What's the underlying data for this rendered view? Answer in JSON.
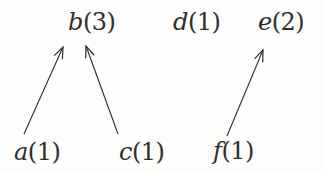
{
  "diagram": {
    "colors": {
      "ink": "#2e2e2e",
      "background": "#fdfdfc"
    },
    "nodes": [
      {
        "id": "b",
        "letter": "b",
        "count": "(3)",
        "label": "b(3)",
        "row": "top"
      },
      {
        "id": "d",
        "letter": "d",
        "count": "(1)",
        "label": "d(1)",
        "row": "top"
      },
      {
        "id": "e",
        "letter": "e",
        "count": "(2)",
        "label": "e(2)",
        "row": "top"
      },
      {
        "id": "a",
        "letter": "a",
        "count": "(1)",
        "label": "a(1)",
        "row": "bottom"
      },
      {
        "id": "c",
        "letter": "c",
        "count": "(1)",
        "label": "c(1)",
        "row": "bottom"
      },
      {
        "id": "f",
        "letter": "f",
        "count": "(1)",
        "label": "f(1)",
        "row": "bottom"
      }
    ],
    "edges": [
      {
        "from": "a",
        "to": "b"
      },
      {
        "from": "c",
        "to": "b"
      },
      {
        "from": "f",
        "to": "e"
      }
    ]
  }
}
